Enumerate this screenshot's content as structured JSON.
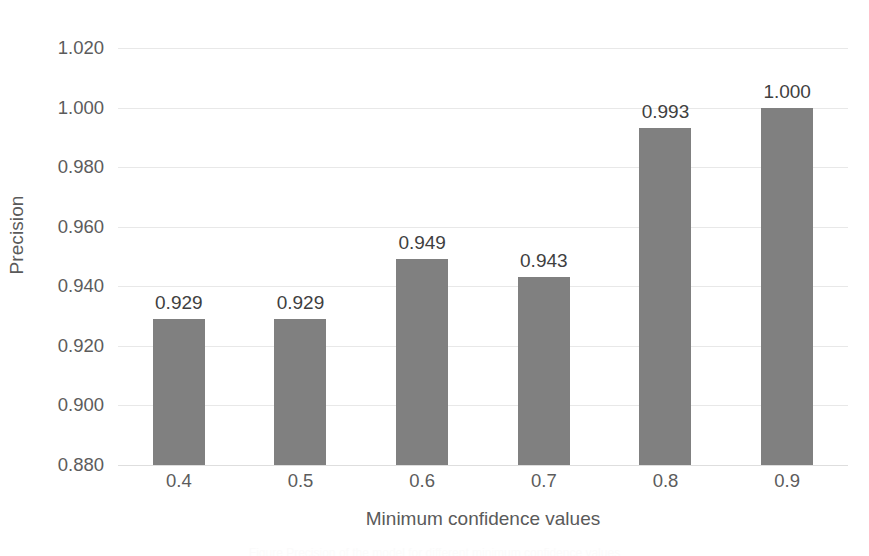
{
  "chart_data": {
    "type": "bar",
    "title": "",
    "subtitle": "",
    "xlabel": "Minimum confidence values",
    "ylabel": "Precision",
    "categories": [
      "0.4",
      "0.5",
      "0.6",
      "0.7",
      "0.8",
      "0.9"
    ],
    "values": [
      0.929,
      0.929,
      0.949,
      0.943,
      0.993,
      1.0
    ],
    "data_labels": [
      "0.929",
      "0.929",
      "0.949",
      "0.943",
      "0.993",
      "1.000"
    ],
    "series": [
      {
        "name": "Precision",
        "values": [
          0.929,
          0.929,
          0.949,
          0.943,
          0.993,
          1.0
        ],
        "color": "#808080"
      }
    ],
    "ylim": [
      0.88,
      1.02
    ],
    "ytick_values": [
      1.02,
      1.0,
      0.98,
      0.96,
      0.94,
      0.92,
      0.9,
      0.88
    ],
    "ytick_labels": [
      "1.020",
      "1.000",
      "0.980",
      "0.960",
      "0.940",
      "0.920",
      "0.900",
      "0.880"
    ],
    "ytick_step": 0.02,
    "xtick_labels": [
      "0.4",
      "0.5",
      "0.6",
      "0.7",
      "0.8",
      "0.9"
    ],
    "grid": true,
    "grid_axis": "y",
    "legend": false,
    "legend_position": "none",
    "bar_color": "#808080",
    "gridline_color": "#e8e8e8",
    "axis_text_color": "#5c5c5c",
    "label_text_color": "#3f3f3f",
    "background_color": "#ffffff"
  },
  "caption_sliver": "Figure  Precision of the model for different minimum confidence values"
}
